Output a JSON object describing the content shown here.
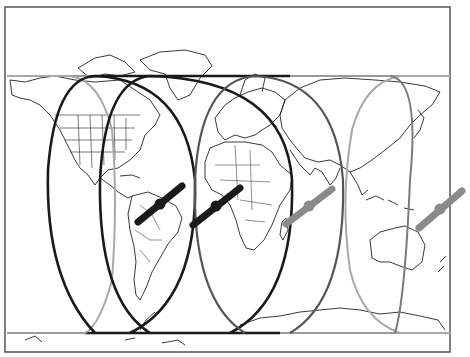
{
  "figure": {
    "frame": {
      "x": 5,
      "y": 7,
      "width": 445,
      "height": 345,
      "color": "#555555"
    },
    "colors": {
      "land_outline": "#222222",
      "orbit_black": "#1a1a1a",
      "orbit_dark_gray": "#555555",
      "orbit_light_gray": "#a8a8a8",
      "satellite_black": "#1a1a1a",
      "satellite_gray": "#8a8a8a"
    },
    "bands": [
      {
        "name": "north-track-line",
        "y": 76,
        "x1": 7,
        "x2": 450,
        "color": "#9a9a9a"
      },
      {
        "name": "south-track-line",
        "y": 333,
        "x1": 7,
        "x2": 450,
        "color": "#9a9a9a"
      }
    ],
    "orbits": [
      {
        "name": "orbit-1",
        "x_left": 45,
        "x_right": 195,
        "y_top": 76,
        "y_bottom": 333,
        "color": "#1a1a1a",
        "width": 2.6
      },
      {
        "name": "orbit-2",
        "x_left": 98,
        "x_right": 292,
        "y_top": 76,
        "y_bottom": 333,
        "color": "#1a1a1a",
        "width": 2.6
      },
      {
        "name": "orbit-3",
        "x_left": 190,
        "x_right": 345,
        "y_top": 76,
        "y_bottom": 333,
        "color": "#555555",
        "width": 2.2
      },
      {
        "name": "orbit-4",
        "x_left": 330,
        "x_right": 410,
        "y_top": 76,
        "y_bottom": 333,
        "color": "#a8a8a8",
        "width": 2.0
      }
    ],
    "satellites": [
      {
        "name": "satellite-1",
        "x1": 138,
        "y1": 222,
        "x2": 182,
        "y2": 186,
        "color": "#1a1a1a"
      },
      {
        "name": "satellite-2",
        "x1": 193,
        "y1": 225,
        "x2": 240,
        "y2": 188,
        "color": "#1a1a1a"
      },
      {
        "name": "satellite-3",
        "x1": 286,
        "y1": 224,
        "x2": 332,
        "y2": 189,
        "color": "#8a8a8a"
      },
      {
        "name": "satellite-4",
        "x1": 419,
        "y1": 228,
        "x2": 462,
        "y2": 191,
        "color": "#8a8a8a"
      }
    ]
  }
}
